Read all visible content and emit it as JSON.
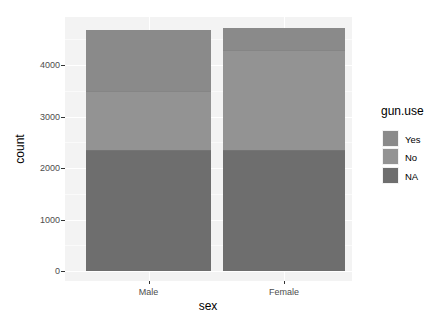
{
  "chart_data": {
    "type": "bar",
    "stacked": true,
    "title": "",
    "xlabel": "sex",
    "ylabel": "count",
    "categories": [
      "Male",
      "Female"
    ],
    "series": [
      {
        "name": "NA",
        "values": [
          2350,
          2350
        ],
        "color": "#6e6e6e"
      },
      {
        "name": "No",
        "values": [
          1150,
          1940
        ],
        "color": "#939393"
      },
      {
        "name": "Yes",
        "values": [
          1180,
          430
        ],
        "color": "#8a8a8a"
      }
    ],
    "totals": [
      4680,
      4720
    ],
    "yticks": [
      0,
      1000,
      2000,
      3000,
      4000
    ],
    "ylim": [
      0,
      4940
    ],
    "grid": true,
    "legend": {
      "title": "gun.use",
      "position": "right",
      "entries": [
        "Yes",
        "No",
        "NA"
      ]
    }
  },
  "axis": {
    "y_tick_labels": [
      "0",
      "1000",
      "2000",
      "3000",
      "4000"
    ],
    "x_tick_labels": [
      "Male",
      "Female"
    ],
    "xlabel": "sex",
    "ylabel": "count"
  },
  "legend": {
    "title": "gun.use",
    "items": [
      {
        "label": "Yes",
        "color": "#8a8a8a"
      },
      {
        "label": "No",
        "color": "#939393"
      },
      {
        "label": "NA",
        "color": "#6e6e6e"
      }
    ]
  }
}
